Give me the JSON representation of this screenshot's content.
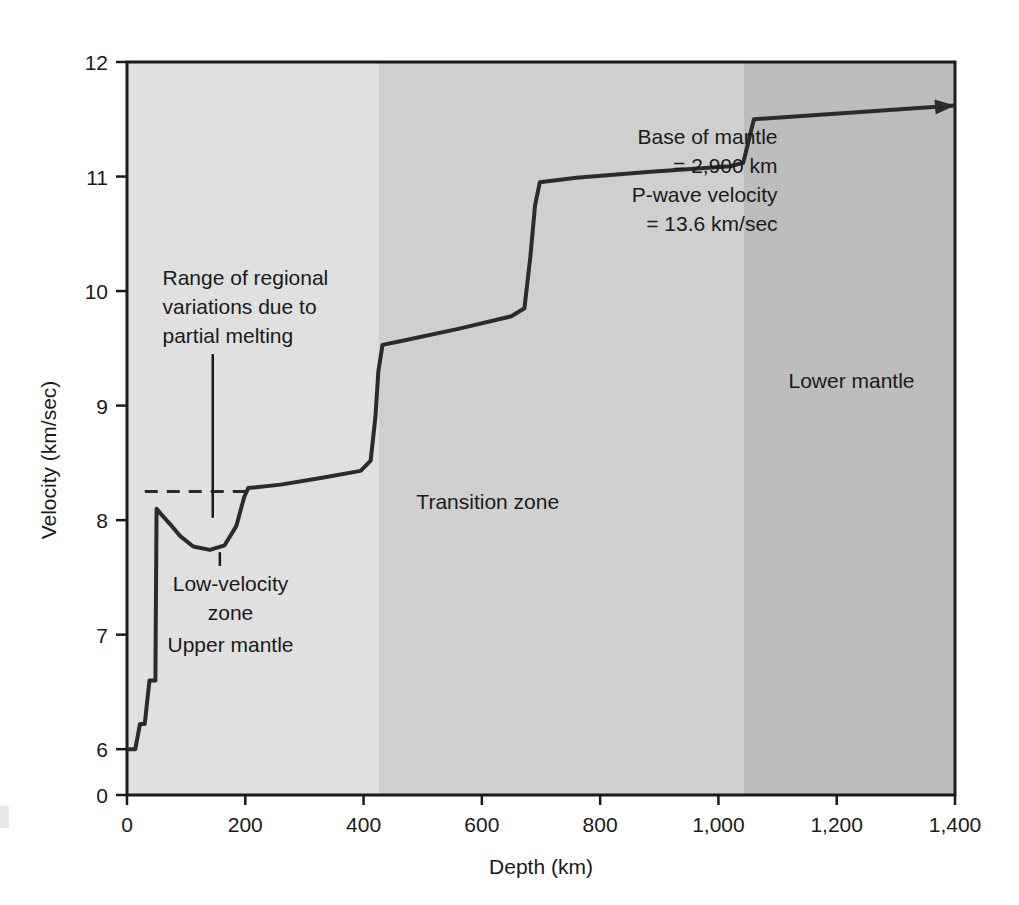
{
  "chart_data": {
    "type": "line",
    "title": "",
    "xlabel": "Depth (km)",
    "ylabel": "Velocity (km/sec)",
    "xlim": [
      0,
      1400
    ],
    "ylim": [
      5.6,
      12
    ],
    "grid": false,
    "legend_position": "none",
    "x_ticks": [
      {
        "value": 0,
        "label": "0"
      },
      {
        "value": 200,
        "label": "200"
      },
      {
        "value": 400,
        "label": "400"
      },
      {
        "value": 600,
        "label": "600"
      },
      {
        "value": 800,
        "label": "800"
      },
      {
        "value": 1000,
        "label": "1,000"
      },
      {
        "value": 1200,
        "label": "1,200"
      },
      {
        "value": 1400,
        "label": "1,400"
      }
    ],
    "y_ticks": [
      {
        "value": 5.6,
        "label": "0"
      },
      {
        "value": 6,
        "label": "6"
      },
      {
        "value": 7,
        "label": "7"
      },
      {
        "value": 8,
        "label": "8"
      },
      {
        "value": 9,
        "label": "9"
      },
      {
        "value": 10,
        "label": "10"
      },
      {
        "value": 11,
        "label": "11"
      },
      {
        "value": 12,
        "label": "12"
      }
    ],
    "y_axis_broken": true,
    "series": [
      {
        "name": "P-wave velocity",
        "points": [
          [
            0,
            6.0
          ],
          [
            14,
            6.0
          ],
          [
            22,
            6.22
          ],
          [
            30,
            6.22
          ],
          [
            38,
            6.6
          ],
          [
            48,
            6.6
          ],
          [
            50,
            8.1
          ],
          [
            58,
            8.05
          ],
          [
            72,
            7.97
          ],
          [
            90,
            7.86
          ],
          [
            112,
            7.77
          ],
          [
            140,
            7.74
          ],
          [
            165,
            7.78
          ],
          [
            185,
            7.95
          ],
          [
            198,
            8.2
          ],
          [
            205,
            8.28
          ],
          [
            260,
            8.31
          ],
          [
            330,
            8.37
          ],
          [
            395,
            8.43
          ],
          [
            412,
            8.52
          ],
          [
            420,
            8.9
          ],
          [
            425,
            9.3
          ],
          [
            432,
            9.53
          ],
          [
            470,
            9.57
          ],
          [
            560,
            9.67
          ],
          [
            650,
            9.78
          ],
          [
            672,
            9.85
          ],
          [
            682,
            10.3
          ],
          [
            690,
            10.75
          ],
          [
            698,
            10.95
          ],
          [
            760,
            10.99
          ],
          [
            880,
            11.04
          ],
          [
            1020,
            11.09
          ],
          [
            1042,
            11.12
          ],
          [
            1060,
            11.5
          ],
          [
            1400,
            11.62
          ]
        ]
      }
    ],
    "regions": [
      {
        "name": "Upper mantle",
        "label": "Upper mantle",
        "x_start": 0,
        "x_end": 425,
        "color": "#e0e0e0"
      },
      {
        "name": "Transition zone",
        "label": "Transition zone",
        "x_start": 425,
        "x_end": 1042,
        "color": "#cfcfcf"
      },
      {
        "name": "Lower mantle",
        "label": "Lower mantle",
        "x_start": 1042,
        "x_end": 1400,
        "color": "#bdbdbd"
      }
    ],
    "reference_lines": [
      {
        "name": "range-of-regional-variations-dashed",
        "style": "dashed",
        "y": 8.25,
        "x_start": 30,
        "x_end": 200
      }
    ],
    "annotations": [
      {
        "name": "regional-variations",
        "lines": [
          "Range of regional",
          "variations due to",
          "partial melting"
        ],
        "text_x": 60,
        "text_y": 10.05,
        "leader_from": [
          145,
          9.45
        ],
        "leader_to": [
          145,
          8.02
        ]
      },
      {
        "name": "low-velocity-zone",
        "lines": [
          "Low-velocity",
          "zone"
        ],
        "text_x": 175,
        "text_y": 7.38,
        "leader_from": [
          157,
          7.6
        ],
        "leader_to": [
          157,
          7.72
        ]
      },
      {
        "name": "base-of-mantle",
        "lines": [
          "Base of mantle",
          "= 2,900 km",
          "P-wave velocity",
          "= 13.6 km/sec"
        ],
        "text_x": 1100,
        "text_y": 11.28
      }
    ],
    "region_labels": [
      {
        "name": "upper-mantle-label",
        "text": "Upper mantle",
        "x": 175,
        "y": 6.85
      },
      {
        "name": "low-velocity-zone-label",
        "text": "Low-velocity zone",
        "x": 175,
        "y": 7.38
      },
      {
        "name": "transition-zone-label",
        "text": "Transition zone",
        "x": 610,
        "y": 8.1
      },
      {
        "name": "lower-mantle-label",
        "text": "Lower mantle",
        "x": 1225,
        "y": 9.15
      }
    ],
    "arrow": {
      "name": "continues-arrow",
      "description": "curve continues off chart to the right",
      "tip_x": 1400,
      "tip_y": 11.62
    },
    "colors": {
      "upper_mantle": "#e0e0e0",
      "transition_zone": "#cfcfcf",
      "lower_mantle": "#bdbdbd",
      "curve": "#2b2b2b",
      "axis": "#1a1a1a",
      "background": "#ffffff"
    }
  }
}
